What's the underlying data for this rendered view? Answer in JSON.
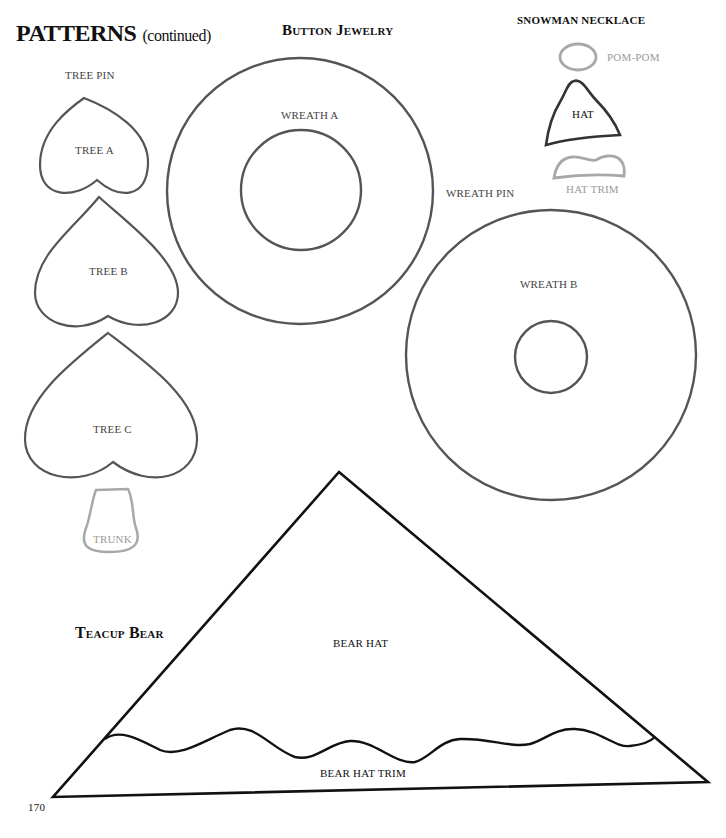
{
  "page": {
    "title": "PATTERNS",
    "title_suffix": "(continued)",
    "page_number": "170"
  },
  "sections": {
    "button_jewelry": "Button Jewelry",
    "snowman_necklace": "SNOWMAN NECKLACE",
    "teacup_bear": "Teacup Bear"
  },
  "labels": {
    "tree_pin": "TREE PIN",
    "tree_a": "TREE A",
    "tree_b": "TREE B",
    "tree_c": "TREE C",
    "trunk": "TRUNK",
    "wreath_a": "WREATH A",
    "wreath_pin": "WREATH PIN",
    "wreath_b": "WREATH B",
    "pom_pom": "POM-POM",
    "hat": "HAT",
    "hat_trim": "HAT TRIM",
    "bear_hat": "BEAR HAT",
    "bear_hat_trim": "BEAR HAT TRIM"
  },
  "colors": {
    "outline_dark": "#555555",
    "outline_light": "#a8a8a8",
    "outline_black": "#111111"
  }
}
